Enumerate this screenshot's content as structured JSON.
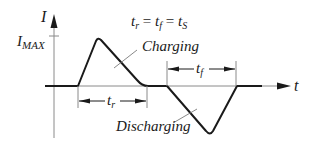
{
  "diagram": {
    "title_equation": "t_r = t_f = t_S",
    "equation_parts": {
      "tr": "t",
      "tr_sub": "r",
      "eq1": " = ",
      "tf": "t",
      "tf_sub": "f",
      "eq2": " = ",
      "ts": "t",
      "ts_sub": "S"
    },
    "y_axis_label": "I",
    "y_max_label": "I",
    "y_max_sub": "MAX",
    "x_axis_label": "t",
    "charging_label": "Charging",
    "discharging_label": "Discharging",
    "rise_time": {
      "label": "t",
      "sub": "r"
    },
    "fall_time": {
      "label": "t",
      "sub": "f"
    },
    "colors": {
      "line": "#1a1a1a",
      "axis": "#8a8a8a",
      "leader": "#7a7a7a"
    }
  }
}
